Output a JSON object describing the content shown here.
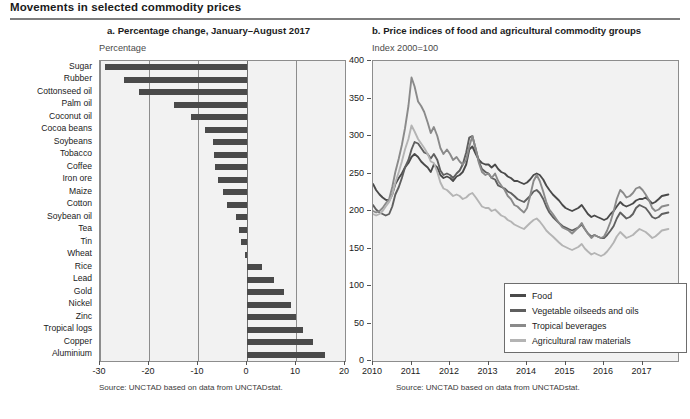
{
  "main_title": "Movements in selected commodity prices",
  "panel_a": {
    "title": "a. Percentage change, January–August 2017",
    "subtitle": "Percentage",
    "source": "Source: UNCTAD based on data from UNCTADstat."
  },
  "panel_b": {
    "title": "b. Price indices of food and agricultural commodity groups",
    "subtitle": "Index 2000=100",
    "source": "Source: UNCTAD based on data from UNCTADstat."
  },
  "colors": {
    "bar": "#4a4a4a",
    "plot_background": "#f2f2f2",
    "axis": "#8d8d8d",
    "food": "#4a4a4a",
    "vegetable_oilseeds_and_oils": "#5f5f5f",
    "tropical_beverages": "#8a8a8a",
    "agricultural_raw_materials": "#b4b4b4"
  },
  "chart_data": [
    {
      "type": "bar",
      "title": "a. Percentage change, January–August 2017",
      "xlabel": "Percentage",
      "ylabel": "",
      "orientation": "horizontal",
      "xlim": [
        -30,
        20
      ],
      "xticks": [
        -30,
        -20,
        -10,
        0,
        10,
        20
      ],
      "grid": true,
      "categories": [
        "Sugar",
        "Rubber",
        "Cottonseed oil",
        "Palm oil",
        "Coconut oil",
        "Cocoa beans",
        "Soybeans",
        "Tobacco",
        "Coffee",
        "Iron ore",
        "Maize",
        "Cotton",
        "Soybean oil",
        "Tea",
        "Tin",
        "Wheat",
        "Rice",
        "Lead",
        "Gold",
        "Nickel",
        "Zinc",
        "Tropical logs",
        "Copper",
        "Aluminium"
      ],
      "values": [
        -29.0,
        -25.2,
        -22.0,
        -15.0,
        -11.5,
        -8.5,
        -7.0,
        -6.8,
        -6.5,
        -6.0,
        -5.0,
        -4.0,
        -2.2,
        -1.6,
        -1.2,
        -0.4,
        3.0,
        5.5,
        7.5,
        9.0,
        10.0,
        11.5,
        13.5,
        16.0
      ]
    },
    {
      "type": "line",
      "title": "b. Price indices of food and agricultural commodity groups",
      "xlabel": "",
      "ylabel": "Index 2000=100",
      "ylim": [
        0,
        400
      ],
      "yticks": [
        0,
        50,
        100,
        150,
        200,
        250,
        300,
        350,
        400
      ],
      "xticks": [
        "2010",
        "2011",
        "2012",
        "2013",
        "2014",
        "2015",
        "2016",
        "2017"
      ],
      "xlim": [
        2010,
        2017.92
      ],
      "grid": false,
      "legend_position": "bottom-right",
      "x": [
        2010.0,
        2010.08,
        2010.17,
        2010.25,
        2010.33,
        2010.42,
        2010.5,
        2010.58,
        2010.67,
        2010.75,
        2010.83,
        2010.92,
        2011.0,
        2011.08,
        2011.17,
        2011.25,
        2011.33,
        2011.42,
        2011.5,
        2011.58,
        2011.67,
        2011.75,
        2011.83,
        2011.92,
        2012.0,
        2012.08,
        2012.17,
        2012.25,
        2012.33,
        2012.42,
        2012.5,
        2012.58,
        2012.67,
        2012.75,
        2012.83,
        2012.92,
        2013.0,
        2013.08,
        2013.17,
        2013.25,
        2013.33,
        2013.42,
        2013.5,
        2013.58,
        2013.67,
        2013.75,
        2013.83,
        2013.92,
        2014.0,
        2014.08,
        2014.17,
        2014.25,
        2014.33,
        2014.42,
        2014.5,
        2014.58,
        2014.67,
        2014.75,
        2014.83,
        2014.92,
        2015.0,
        2015.08,
        2015.17,
        2015.25,
        2015.33,
        2015.42,
        2015.5,
        2015.58,
        2015.67,
        2015.75,
        2015.83,
        2015.92,
        2016.0,
        2016.08,
        2016.17,
        2016.25,
        2016.33,
        2016.42,
        2016.5,
        2016.58,
        2016.67,
        2016.75,
        2016.83,
        2016.92,
        2017.0,
        2017.08,
        2017.17,
        2017.25,
        2017.33,
        2017.42,
        2017.5,
        2017.67
      ],
      "series": [
        {
          "name": "Food",
          "color": "#4a4a4a",
          "values": [
            236,
            228,
            222,
            218,
            215,
            214,
            222,
            236,
            244,
            250,
            258,
            264,
            272,
            276,
            272,
            266,
            262,
            258,
            252,
            262,
            258,
            248,
            244,
            246,
            244,
            240,
            246,
            248,
            252,
            262,
            282,
            286,
            276,
            268,
            264,
            262,
            262,
            258,
            262,
            256,
            252,
            250,
            246,
            244,
            240,
            240,
            238,
            236,
            238,
            242,
            248,
            250,
            248,
            242,
            234,
            228,
            222,
            218,
            214,
            208,
            204,
            202,
            200,
            202,
            204,
            208,
            202,
            196,
            192,
            194,
            192,
            190,
            188,
            190,
            196,
            200,
            206,
            212,
            208,
            206,
            208,
            210,
            214,
            216,
            216,
            218,
            214,
            210,
            212,
            216,
            220,
            222
          ]
        },
        {
          "name": "Vegetable oilseeds and oils",
          "color": "#5f5f5f",
          "values": [
            208,
            202,
            198,
            196,
            194,
            196,
            206,
            222,
            232,
            244,
            258,
            268,
            282,
            292,
            290,
            284,
            278,
            276,
            270,
            276,
            268,
            254,
            248,
            250,
            248,
            244,
            250,
            254,
            262,
            278,
            298,
            300,
            282,
            266,
            256,
            252,
            250,
            244,
            242,
            234,
            232,
            230,
            226,
            224,
            220,
            216,
            214,
            212,
            216,
            220,
            226,
            228,
            224,
            216,
            206,
            198,
            192,
            188,
            184,
            180,
            178,
            176,
            174,
            176,
            178,
            182,
            176,
            170,
            166,
            168,
            166,
            164,
            164,
            168,
            174,
            180,
            190,
            198,
            194,
            190,
            192,
            196,
            204,
            208,
            206,
            204,
            198,
            192,
            190,
            192,
            196,
            198
          ]
        },
        {
          "name": "Tropical beverages",
          "color": "#8a8a8a",
          "values": [
            200,
            198,
            200,
            204,
            210,
            216,
            232,
            252,
            270,
            288,
            310,
            340,
            378,
            366,
            346,
            340,
            332,
            318,
            304,
            312,
            300,
            284,
            276,
            282,
            276,
            268,
            272,
            266,
            262,
            268,
            286,
            300,
            282,
            264,
            252,
            248,
            250,
            244,
            250,
            240,
            234,
            228,
            220,
            216,
            208,
            206,
            202,
            198,
            204,
            220,
            240,
            248,
            240,
            226,
            212,
            202,
            196,
            190,
            184,
            178,
            176,
            174,
            170,
            174,
            178,
            184,
            176,
            170,
            164,
            168,
            166,
            164,
            166,
            174,
            186,
            200,
            216,
            228,
            224,
            218,
            220,
            224,
            230,
            232,
            228,
            222,
            214,
            204,
            200,
            202,
            206,
            208
          ]
        },
        {
          "name": "Agricultural raw materials",
          "color": "#b4b4b4",
          "values": [
            196,
            194,
            196,
            200,
            206,
            212,
            222,
            238,
            252,
            266,
            282,
            296,
            314,
            306,
            296,
            290,
            284,
            276,
            266,
            264,
            252,
            238,
            230,
            228,
            224,
            220,
            222,
            220,
            216,
            218,
            222,
            224,
            218,
            212,
            206,
            204,
            204,
            200,
            202,
            198,
            194,
            192,
            188,
            186,
            182,
            180,
            178,
            176,
            180,
            184,
            188,
            190,
            186,
            180,
            174,
            170,
            166,
            162,
            158,
            154,
            152,
            150,
            148,
            150,
            152,
            156,
            150,
            146,
            142,
            144,
            142,
            140,
            142,
            146,
            152,
            158,
            166,
            172,
            168,
            164,
            166,
            168,
            172,
            176,
            174,
            172,
            168,
            164,
            166,
            170,
            174,
            176
          ]
        }
      ]
    }
  ]
}
